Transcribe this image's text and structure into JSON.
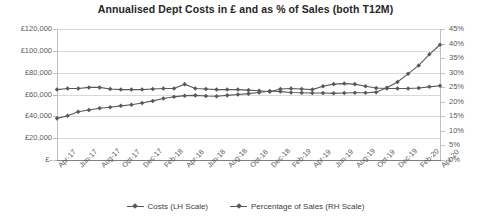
{
  "chart_data": {
    "type": "line",
    "title": "Annualised Dept Costs in £ and as % of Sales (both T12M)",
    "xlabel": "",
    "ylabel": "",
    "grid": true,
    "legend_position": "bottom",
    "categories": [
      "Apr-17",
      "May-17",
      "Jun-17",
      "Jul-17",
      "Aug-17",
      "Sep-17",
      "Oct-17",
      "Nov-17",
      "Dec-17",
      "Jan-18",
      "Feb-18",
      "Mar-18",
      "Apr-18",
      "May-18",
      "Jun-18",
      "Jul-18",
      "Aug-18",
      "Sep-18",
      "Oct-18",
      "Nov-18",
      "Dec-18",
      "Jan-19",
      "Feb-19",
      "Mar-19",
      "Apr-19",
      "May-19",
      "Jun-19",
      "Jul-19",
      "Aug-19",
      "Sep-19",
      "Oct-19",
      "Nov-19",
      "Dec-19",
      "Jan-20",
      "Feb-20",
      "Mar-20",
      "Apr-20"
    ],
    "tick_labels": [
      "Apr-17",
      "Jun-17",
      "Aug-17",
      "Oct-17",
      "Dec-17",
      "Feb-18",
      "Apr-18",
      "Jun-18",
      "Aug-18",
      "Oct-18",
      "Dec-18",
      "Feb-19",
      "Apr-19",
      "Jun-19",
      "Aug-19",
      "Oct-19",
      "Dec-19",
      "Feb-20",
      "Apr-20"
    ],
    "axes": {
      "left": {
        "ylim": [
          0,
          120000
        ],
        "ticks": [
          0,
          20000,
          40000,
          60000,
          80000,
          100000,
          120000
        ],
        "tick_labels": [
          "£-",
          "£20,000",
          "£40,000",
          "£60,000",
          "£80,000",
          "£100,000",
          "£120,000"
        ]
      },
      "right": {
        "ylim": [
          0,
          0.45
        ],
        "ticks": [
          0,
          0.05,
          0.1,
          0.15,
          0.2,
          0.25,
          0.3,
          0.35,
          0.4,
          0.45
        ],
        "tick_labels": [
          "0%",
          "5%",
          "10%",
          "15%",
          "20%",
          "25%",
          "30%",
          "35%",
          "40%",
          "45%"
        ]
      }
    },
    "series": [
      {
        "name": "Costs (LH Scale)",
        "axis": "left",
        "color": "#595959",
        "values": [
          64500,
          65500,
          65500,
          66500,
          66500,
          65000,
          64500,
          64500,
          64500,
          65000,
          65500,
          65500,
          69500,
          65500,
          65000,
          64500,
          64500,
          64500,
          64000,
          63500,
          62500,
          65000,
          65500,
          65000,
          64500,
          67500,
          69500,
          70000,
          69500,
          67500,
          66000,
          65500,
          65500,
          65500,
          66000,
          67000,
          68000
        ]
      },
      {
        "name": "Percentage of Sales (RH Scale)",
        "axis": "right",
        "color": "#595959",
        "values": [
          0.143,
          0.152,
          0.166,
          0.172,
          0.178,
          0.181,
          0.186,
          0.19,
          0.196,
          0.203,
          0.211,
          0.217,
          0.221,
          0.222,
          0.22,
          0.219,
          0.222,
          0.225,
          0.228,
          0.232,
          0.237,
          0.235,
          0.232,
          0.231,
          0.23,
          0.23,
          0.229,
          0.23,
          0.231,
          0.231,
          0.233,
          0.248,
          0.268,
          0.296,
          0.325,
          0.363,
          0.396
        ]
      }
    ]
  }
}
